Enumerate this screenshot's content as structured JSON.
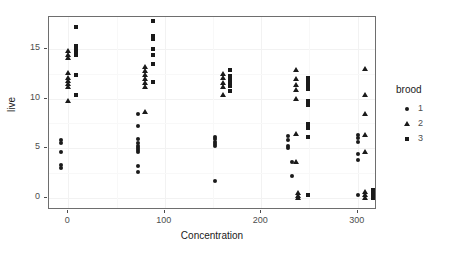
{
  "chart_data": {
    "type": "scatter",
    "title": "",
    "xlabel": "Concentration",
    "ylabel": "live",
    "xlim": [
      -20,
      320
    ],
    "ylim": [
      -1.2,
      18.2
    ],
    "xticks": [
      0,
      100,
      200,
      300
    ],
    "yticks": [
      0,
      5,
      10,
      15
    ],
    "xtick_labels": [
      "0",
      "100",
      "200",
      "300"
    ],
    "ytick_labels": [
      "0",
      "5",
      "10",
      "15"
    ],
    "grid": true,
    "legend": {
      "title": "brood",
      "position": "right",
      "entries": [
        {
          "label": "1",
          "marker": "circle"
        },
        {
          "label": "2",
          "marker": "triangle"
        },
        {
          "label": "3",
          "marker": "square"
        }
      ]
    },
    "series": [
      {
        "name": "1",
        "marker": "circle",
        "points": [
          [
            -8,
            5.8
          ],
          [
            -8,
            5.5
          ],
          [
            -8,
            4.6
          ],
          [
            -8,
            3.3
          ],
          [
            -8,
            3.0
          ],
          [
            72,
            8.4
          ],
          [
            72,
            7.2
          ],
          [
            72,
            5.9
          ],
          [
            72,
            5.5
          ],
          [
            72,
            5.2
          ],
          [
            72,
            5.0
          ],
          [
            72,
            4.8
          ],
          [
            72,
            4.6
          ],
          [
            72,
            3.2
          ],
          [
            72,
            2.6
          ],
          [
            152,
            6.1
          ],
          [
            152,
            5.9
          ],
          [
            152,
            5.6
          ],
          [
            152,
            5.4
          ],
          [
            152,
            5.2
          ],
          [
            152,
            1.7
          ],
          [
            228,
            6.2
          ],
          [
            228,
            5.8
          ],
          [
            228,
            5.2
          ],
          [
            228,
            5.0
          ],
          [
            232,
            3.6
          ],
          [
            232,
            2.2
          ],
          [
            300,
            6.3
          ],
          [
            300,
            6.0
          ],
          [
            300,
            5.6
          ],
          [
            300,
            4.4
          ],
          [
            300,
            3.8
          ],
          [
            300,
            0.3
          ]
        ]
      },
      {
        "name": "2",
        "marker": "triangle",
        "points": [
          [
            0,
            14.8
          ],
          [
            0,
            14.4
          ],
          [
            0,
            14.1
          ],
          [
            0,
            12.6
          ],
          [
            0,
            12.1
          ],
          [
            0,
            11.8
          ],
          [
            0,
            11.5
          ],
          [
            0,
            11.2
          ],
          [
            0,
            9.8
          ],
          [
            80,
            8.7
          ],
          [
            80,
            13.2
          ],
          [
            80,
            12.8
          ],
          [
            80,
            12.4
          ],
          [
            80,
            12.0
          ],
          [
            80,
            11.6
          ],
          [
            80,
            11.2
          ],
          [
            160,
            12.5
          ],
          [
            160,
            12.1
          ],
          [
            160,
            11.6
          ],
          [
            160,
            11.2
          ],
          [
            160,
            10.4
          ],
          [
            236,
            12.9
          ],
          [
            236,
            12.0
          ],
          [
            236,
            11.4
          ],
          [
            236,
            10.9
          ],
          [
            236,
            10.0
          ],
          [
            236,
            6.4
          ],
          [
            236,
            3.6
          ],
          [
            238,
            0.5
          ],
          [
            238,
            0.2
          ],
          [
            238,
            0.0
          ],
          [
            308,
            13.0
          ],
          [
            308,
            10.4
          ],
          [
            308,
            8.5
          ],
          [
            308,
            6.3
          ],
          [
            308,
            4.6
          ],
          [
            308,
            0.6
          ],
          [
            308,
            0.3
          ],
          [
            308,
            0.0
          ]
        ]
      },
      {
        "name": "3",
        "marker": "square",
        "points": [
          [
            8,
            17.2
          ],
          [
            8,
            15.3
          ],
          [
            8,
            15.0
          ],
          [
            8,
            14.7
          ],
          [
            8,
            14.4
          ],
          [
            8,
            12.4
          ],
          [
            8,
            10.4
          ],
          [
            88,
            17.8
          ],
          [
            88,
            16.3
          ],
          [
            88,
            16.0
          ],
          [
            88,
            15.0
          ],
          [
            88,
            14.4
          ],
          [
            88,
            13.5
          ],
          [
            88,
            11.7
          ],
          [
            168,
            12.9
          ],
          [
            168,
            12.3
          ],
          [
            168,
            12.0
          ],
          [
            168,
            11.7
          ],
          [
            168,
            11.3
          ],
          [
            168,
            10.8
          ],
          [
            248,
            12.1
          ],
          [
            248,
            11.7
          ],
          [
            248,
            11.4
          ],
          [
            248,
            11.0
          ],
          [
            248,
            9.8
          ],
          [
            248,
            9.4
          ],
          [
            248,
            7.4
          ],
          [
            248,
            7.0
          ],
          [
            248,
            6.1
          ],
          [
            248,
            0.3
          ],
          [
            316,
            0.8
          ],
          [
            316,
            0.5
          ],
          [
            316,
            0.2
          ],
          [
            316,
            0.0
          ]
        ]
      }
    ]
  }
}
